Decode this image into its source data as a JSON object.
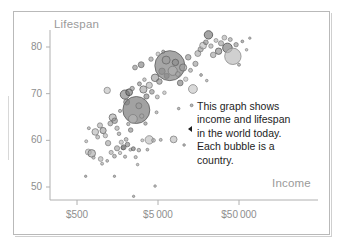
{
  "chart_data": {
    "type": "scatter",
    "title": "",
    "xlabel": "Income",
    "ylabel": "Lifespan",
    "xscale": "log",
    "xlim": [
      300,
      110000
    ],
    "ylim": [
      47,
      84
    ],
    "grid": false,
    "legend": null,
    "xtick_labels": [
      "$500",
      "$5 000",
      "$50 000"
    ],
    "xtick_values": [
      500,
      5000,
      50000
    ],
    "ytick_labels": [
      "50",
      "60",
      "70",
      "80"
    ],
    "ytick_values": [
      50,
      60,
      70,
      80
    ],
    "bubble_meaning": "Each bubble is a country; bubble area is population",
    "annotation": {
      "lines": [
        "This graph shows",
        "income and lifespan",
        "in the world today.",
        "Each bubble is a",
        "country."
      ],
      "pointer_glyph": "left-triangle"
    },
    "points": [
      {
        "income": 640,
        "lifespan": 52.3,
        "r": 1.2,
        "fill": "#8d8d8d",
        "stroke": "#6f6f6f"
      },
      {
        "income": 1450,
        "lifespan": 52.3,
        "r": 1.2,
        "fill": "#8d8d8d",
        "stroke": "#6f6f6f"
      },
      {
        "income": 2500,
        "lifespan": 48.0,
        "r": 1.2,
        "fill": "#8d8d8d",
        "stroke": "#6f6f6f"
      },
      {
        "income": 4600,
        "lifespan": 50.2,
        "r": 1.3,
        "fill": "#9a9a9a",
        "stroke": "#7a7a7a"
      },
      {
        "income": 690,
        "lifespan": 57.5,
        "r": 3.0,
        "fill": "#b5b5b5",
        "stroke": "#7d7d7d"
      },
      {
        "income": 760,
        "lifespan": 57.2,
        "r": 3.8,
        "fill": "#a8a8a8",
        "stroke": "#6e6e6e"
      },
      {
        "income": 800,
        "lifespan": 56.3,
        "r": 1.6,
        "fill": "#9f9f9f",
        "stroke": "#747474"
      },
      {
        "income": 980,
        "lifespan": 56.0,
        "r": 2.4,
        "fill": "#b0b0b0",
        "stroke": "#7a7a7a"
      },
      {
        "income": 1020,
        "lifespan": 55.0,
        "r": 1.5,
        "fill": "#a5a5a5",
        "stroke": "#757575"
      },
      {
        "income": 1180,
        "lifespan": 55.6,
        "r": 1.4,
        "fill": "#9d9d9d",
        "stroke": "#6f6f6f"
      },
      {
        "income": 1320,
        "lifespan": 57.4,
        "r": 2.1,
        "fill": "#a9a9a9",
        "stroke": "#777777"
      },
      {
        "income": 1450,
        "lifespan": 56.6,
        "r": 1.9,
        "fill": "#9b9b9b",
        "stroke": "#6b6b6b"
      },
      {
        "income": 1560,
        "lifespan": 58.3,
        "r": 2.6,
        "fill": "#9c9c9c",
        "stroke": "#6a6a6a"
      },
      {
        "income": 1700,
        "lifespan": 57.3,
        "r": 1.7,
        "fill": "#b2b2b2",
        "stroke": "#7c7c7c"
      },
      {
        "income": 1850,
        "lifespan": 58.4,
        "r": 2.0,
        "fill": "#8e8e8e",
        "stroke": "#636363"
      },
      {
        "income": 1960,
        "lifespan": 56.5,
        "r": 1.6,
        "fill": "#a0a0a0",
        "stroke": "#707070"
      },
      {
        "income": 2100,
        "lifespan": 59.1,
        "r": 2.3,
        "fill": "#7f7f7f",
        "stroke": "#5a5a5a"
      },
      {
        "income": 2280,
        "lifespan": 58.0,
        "r": 1.5,
        "fill": "#a4a4a4",
        "stroke": "#747474"
      },
      {
        "income": 650,
        "lifespan": 59.8,
        "r": 1.5,
        "fill": "#acacac",
        "stroke": "#787878"
      },
      {
        "income": 700,
        "lifespan": 62.6,
        "r": 1.5,
        "fill": "#a3a3a3",
        "stroke": "#707070"
      },
      {
        "income": 840,
        "lifespan": 61.8,
        "r": 3.3,
        "fill": "#b4b4b4",
        "stroke": "#7b7b7b"
      },
      {
        "income": 900,
        "lifespan": 60.7,
        "r": 2.0,
        "fill": "#a6a6a6",
        "stroke": "#727272"
      },
      {
        "income": 960,
        "lifespan": 63.2,
        "r": 2.6,
        "fill": "#ababab",
        "stroke": "#6f6f6f"
      },
      {
        "income": 1050,
        "lifespan": 62.1,
        "r": 3.1,
        "fill": "#9e9e9e",
        "stroke": "#6a6a6a"
      },
      {
        "income": 1120,
        "lifespan": 61.0,
        "r": 2.2,
        "fill": "#b0b0b0",
        "stroke": "#7c7c7c"
      },
      {
        "income": 1210,
        "lifespan": 59.4,
        "r": 2.7,
        "fill": "#a2a2a2",
        "stroke": "#6e6e6e"
      },
      {
        "income": 1290,
        "lifespan": 63.6,
        "r": 2.4,
        "fill": "#999999",
        "stroke": "#676767"
      },
      {
        "income": 1380,
        "lifespan": 64.9,
        "r": 3.6,
        "fill": "#a9a9a9",
        "stroke": "#6c6c6c"
      },
      {
        "income": 1460,
        "lifespan": 64.2,
        "r": 2.8,
        "fill": "#8b8b8b",
        "stroke": "#5f5f5f"
      },
      {
        "income": 1560,
        "lifespan": 62.6,
        "r": 2.2,
        "fill": "#a7a7a7",
        "stroke": "#727272"
      },
      {
        "income": 1650,
        "lifespan": 61.4,
        "r": 1.8,
        "fill": "#9a9a9a",
        "stroke": "#6a6a6a"
      },
      {
        "income": 1760,
        "lifespan": 59.6,
        "r": 2.1,
        "fill": "#b3b3b3",
        "stroke": "#7e7e7e"
      },
      {
        "income": 1880,
        "lifespan": 58.5,
        "r": 2.5,
        "fill": "#7c7c7c",
        "stroke": "#565656"
      },
      {
        "income": 2020,
        "lifespan": 60.2,
        "r": 1.9,
        "fill": "#a1a1a1",
        "stroke": "#6d6d6d"
      },
      {
        "income": 2150,
        "lifespan": 63.5,
        "r": 1.7,
        "fill": "#9d9d9d",
        "stroke": "#6b6b6b"
      },
      {
        "income": 2300,
        "lifespan": 62.2,
        "r": 2.3,
        "fill": "#888888",
        "stroke": "#606060"
      },
      {
        "income": 2480,
        "lifespan": 58.2,
        "r": 2.0,
        "fill": "#717171",
        "stroke": "#4f4f4f"
      },
      {
        "income": 2650,
        "lifespan": 56.4,
        "r": 1.6,
        "fill": "#a5a5a5",
        "stroke": "#747474"
      },
      {
        "income": 2900,
        "lifespan": 57.9,
        "r": 1.8,
        "fill": "#9c9c9c",
        "stroke": "#6d6d6d"
      },
      {
        "income": 3200,
        "lifespan": 60.0,
        "r": 1.5,
        "fill": "#adadad",
        "stroke": "#787878"
      },
      {
        "income": 1180,
        "lifespan": 70.7,
        "r": 3.2,
        "fill": "#bdbdbd",
        "stroke": "#8a8a8a"
      },
      {
        "income": 1700,
        "lifespan": 66.3,
        "r": 1.6,
        "fill": "#9e9e9e",
        "stroke": "#6c6c6c"
      },
      {
        "income": 1950,
        "lifespan": 69.8,
        "r": 4.6,
        "fill": "#7a7a7a",
        "stroke": "#525252"
      },
      {
        "income": 2050,
        "lifespan": 68.2,
        "r": 3.0,
        "fill": "#858585",
        "stroke": "#5c5c5c"
      },
      {
        "income": 2200,
        "lifespan": 70.3,
        "r": 3.4,
        "fill": "#6f6f6f",
        "stroke": "#4a4a4a"
      },
      {
        "income": 2400,
        "lifespan": 71.1,
        "r": 2.2,
        "fill": "#909090",
        "stroke": "#626262"
      },
      {
        "income": 2700,
        "lifespan": 66.5,
        "r": 13.5,
        "fill": "#7e7e7e",
        "stroke": "#5a5a5a"
      },
      {
        "income": 2450,
        "lifespan": 64.6,
        "r": 4.4,
        "fill": "#b6b6b6",
        "stroke": "#808080"
      },
      {
        "income": 2900,
        "lifespan": 67.4,
        "r": 3.0,
        "fill": "#999999",
        "stroke": "#6a6a6a"
      },
      {
        "income": 3150,
        "lifespan": 65.2,
        "r": 2.2,
        "fill": "#a6a6a6",
        "stroke": "#737373"
      },
      {
        "income": 3500,
        "lifespan": 63.6,
        "r": 1.7,
        "fill": "#8f8f8f",
        "stroke": "#646464"
      },
      {
        "income": 3900,
        "lifespan": 60.1,
        "r": 4.2,
        "fill": "#bcbcbc",
        "stroke": "#888888"
      },
      {
        "income": 4400,
        "lifespan": 60.0,
        "r": 1.9,
        "fill": "#a9a9a9",
        "stroke": "#757575"
      },
      {
        "income": 5400,
        "lifespan": 60.1,
        "r": 1.5,
        "fill": "#9f9f9f",
        "stroke": "#707070"
      },
      {
        "income": 7800,
        "lifespan": 60.2,
        "r": 3.4,
        "fill": "#b8b8b8",
        "stroke": "#838383"
      },
      {
        "income": 10500,
        "lifespan": 59.0,
        "r": 1.3,
        "fill": "#949494",
        "stroke": "#6a6a6a"
      },
      {
        "income": 2950,
        "lifespan": 72.1,
        "r": 2.0,
        "fill": "#8b8b8b",
        "stroke": "#5e5e5e"
      },
      {
        "income": 3300,
        "lifespan": 70.9,
        "r": 3.6,
        "fill": "#a0a0a0",
        "stroke": "#6b6b6b"
      },
      {
        "income": 3600,
        "lifespan": 69.4,
        "r": 2.6,
        "fill": "#7e7e7e",
        "stroke": "#585858"
      },
      {
        "income": 3900,
        "lifespan": 71.8,
        "r": 3.1,
        "fill": "#b1b1b1",
        "stroke": "#7d7d7d"
      },
      {
        "income": 4200,
        "lifespan": 70.4,
        "r": 2.4,
        "fill": "#8d8d8d",
        "stroke": "#626262"
      },
      {
        "income": 4600,
        "lifespan": 73.4,
        "r": 3.8,
        "fill": "#989898",
        "stroke": "#676767"
      },
      {
        "income": 4900,
        "lifespan": 69.3,
        "r": 2.0,
        "fill": "#ababab",
        "stroke": "#767676"
      },
      {
        "income": 5200,
        "lifespan": 72.6,
        "r": 2.8,
        "fill": "#878787",
        "stroke": "#5d5d5d"
      },
      {
        "income": 5600,
        "lifespan": 74.8,
        "r": 3.2,
        "fill": "#a4a4a4",
        "stroke": "#707070"
      },
      {
        "income": 6000,
        "lifespan": 70.2,
        "r": 1.8,
        "fill": "#b3b3b3",
        "stroke": "#7f7f7f"
      },
      {
        "income": 6400,
        "lifespan": 73.8,
        "r": 2.6,
        "fill": "#929292",
        "stroke": "#646464"
      },
      {
        "income": 7000,
        "lifespan": 76.0,
        "r": 15.0,
        "fill": "#838383",
        "stroke": "#5c5c5c"
      },
      {
        "income": 6300,
        "lifespan": 77.2,
        "r": 4.0,
        "fill": "#9b9b9b",
        "stroke": "#6a6a6a"
      },
      {
        "income": 7600,
        "lifespan": 74.9,
        "r": 4.6,
        "fill": "#b0b0b0",
        "stroke": "#7b7b7b"
      },
      {
        "income": 8200,
        "lifespan": 76.7,
        "r": 3.2,
        "fill": "#8a8a8a",
        "stroke": "#5f5f5f"
      },
      {
        "income": 8800,
        "lifespan": 74.2,
        "r": 2.4,
        "fill": "#a7a7a7",
        "stroke": "#737373"
      },
      {
        "income": 9400,
        "lifespan": 72.3,
        "r": 2.9,
        "fill": "#797979",
        "stroke": "#545454"
      },
      {
        "income": 10200,
        "lifespan": 75.6,
        "r": 3.6,
        "fill": "#9d9d9d",
        "stroke": "#6b6b6b"
      },
      {
        "income": 11000,
        "lifespan": 73.1,
        "r": 2.2,
        "fill": "#bcbcbc",
        "stroke": "#878787"
      },
      {
        "income": 11800,
        "lifespan": 77.8,
        "r": 2.8,
        "fill": "#8e8e8e",
        "stroke": "#626262"
      },
      {
        "income": 12600,
        "lifespan": 75.0,
        "r": 2.0,
        "fill": "#a2a2a2",
        "stroke": "#6e6e6e"
      },
      {
        "income": 13500,
        "lifespan": 71.0,
        "r": 4.4,
        "fill": "#c2c2c2",
        "stroke": "#8c8c8c"
      },
      {
        "income": 14500,
        "lifespan": 76.4,
        "r": 2.6,
        "fill": "#979797",
        "stroke": "#676767"
      },
      {
        "income": 2600,
        "lifespan": 75.6,
        "r": 2.4,
        "fill": "#8a8a8a",
        "stroke": "#5e5e5e"
      },
      {
        "income": 3100,
        "lifespan": 76.2,
        "r": 3.0,
        "fill": "#7d7d7d",
        "stroke": "#575757"
      },
      {
        "income": 3400,
        "lifespan": 73.0,
        "r": 1.8,
        "fill": "#a8a8a8",
        "stroke": "#757575"
      },
      {
        "income": 4100,
        "lifespan": 77.4,
        "r": 2.2,
        "fill": "#9a9a9a",
        "stroke": "#696969"
      },
      {
        "income": 5000,
        "lifespan": 78.5,
        "r": 2.0,
        "fill": "#b4b4b4",
        "stroke": "#808080"
      },
      {
        "income": 5800,
        "lifespan": 79.0,
        "r": 1.6,
        "fill": "#8f8f8f",
        "stroke": "#636363"
      },
      {
        "income": 15500,
        "lifespan": 78.6,
        "r": 3.0,
        "fill": "#a5a5a5",
        "stroke": "#717171"
      },
      {
        "income": 16800,
        "lifespan": 79.5,
        "r": 2.6,
        "fill": "#949494",
        "stroke": "#666666"
      },
      {
        "income": 18000,
        "lifespan": 80.3,
        "r": 3.4,
        "fill": "#b9b9b9",
        "stroke": "#858585"
      },
      {
        "income": 19500,
        "lifespan": 81.0,
        "r": 2.4,
        "fill": "#8b8b8b",
        "stroke": "#5f5f5f"
      },
      {
        "income": 21000,
        "lifespan": 82.6,
        "r": 4.2,
        "fill": "#6d6d6d",
        "stroke": "#4a4a4a"
      },
      {
        "income": 22500,
        "lifespan": 80.2,
        "r": 2.2,
        "fill": "#a6a6a6",
        "stroke": "#737373"
      },
      {
        "income": 24000,
        "lifespan": 78.3,
        "r": 2.8,
        "fill": "#9e9e9e",
        "stroke": "#6c6c6c"
      },
      {
        "income": 26000,
        "lifespan": 81.4,
        "r": 2.0,
        "fill": "#b2b2b2",
        "stroke": "#7e7e7e"
      },
      {
        "income": 28000,
        "lifespan": 79.1,
        "r": 3.2,
        "fill": "#878787",
        "stroke": "#5c5c5c"
      },
      {
        "income": 30000,
        "lifespan": 80.8,
        "r": 2.6,
        "fill": "#9c9c9c",
        "stroke": "#6a6a6a"
      },
      {
        "income": 33000,
        "lifespan": 82.0,
        "r": 2.4,
        "fill": "#adadad",
        "stroke": "#787878"
      },
      {
        "income": 36000,
        "lifespan": 79.8,
        "r": 4.8,
        "fill": "#707070",
        "stroke": "#4c4c4c"
      },
      {
        "income": 39000,
        "lifespan": 81.6,
        "r": 2.0,
        "fill": "#a0a0a0",
        "stroke": "#6e6e6e"
      },
      {
        "income": 42000,
        "lifespan": 78.0,
        "r": 8.2,
        "fill": "#bebebe",
        "stroke": "#8a8a8a"
      },
      {
        "income": 46000,
        "lifespan": 80.5,
        "r": 2.2,
        "fill": "#929292",
        "stroke": "#646464"
      },
      {
        "income": 50000,
        "lifespan": 76.2,
        "r": 1.5,
        "fill": "#9a9a9a",
        "stroke": "#6b6b6b"
      },
      {
        "income": 55000,
        "lifespan": 81.2,
        "r": 1.4,
        "fill": "#8d8d8d",
        "stroke": "#626262"
      },
      {
        "income": 62000,
        "lifespan": 79.4,
        "r": 1.3,
        "fill": "#a8a8a8",
        "stroke": "#757575"
      },
      {
        "income": 68000,
        "lifespan": 81.9,
        "r": 1.2,
        "fill": "#9d9d9d",
        "stroke": "#6d6d6d"
      },
      {
        "income": 17000,
        "lifespan": 74.0,
        "r": 1.4,
        "fill": "#999999",
        "stroke": "#686868"
      },
      {
        "income": 20000,
        "lifespan": 72.8,
        "r": 1.3,
        "fill": "#a3a3a3",
        "stroke": "#717171"
      },
      {
        "income": 13000,
        "lifespan": 67.5,
        "r": 1.4,
        "fill": "#8f8f8f",
        "stroke": "#626262"
      },
      {
        "income": 9000,
        "lifespan": 66.8,
        "r": 1.3,
        "fill": "#959595",
        "stroke": "#686868"
      },
      {
        "income": 4800,
        "lifespan": 66.0,
        "r": 1.5,
        "fill": "#a1a1a1",
        "stroke": "#707070"
      },
      {
        "income": 3700,
        "lifespan": 58.0,
        "r": 1.4,
        "fill": "#9b9b9b",
        "stroke": "#6b6b6b"
      },
      {
        "income": 2800,
        "lifespan": 54.8,
        "r": 1.3,
        "fill": "#a6a6a6",
        "stroke": "#747474"
      }
    ]
  }
}
